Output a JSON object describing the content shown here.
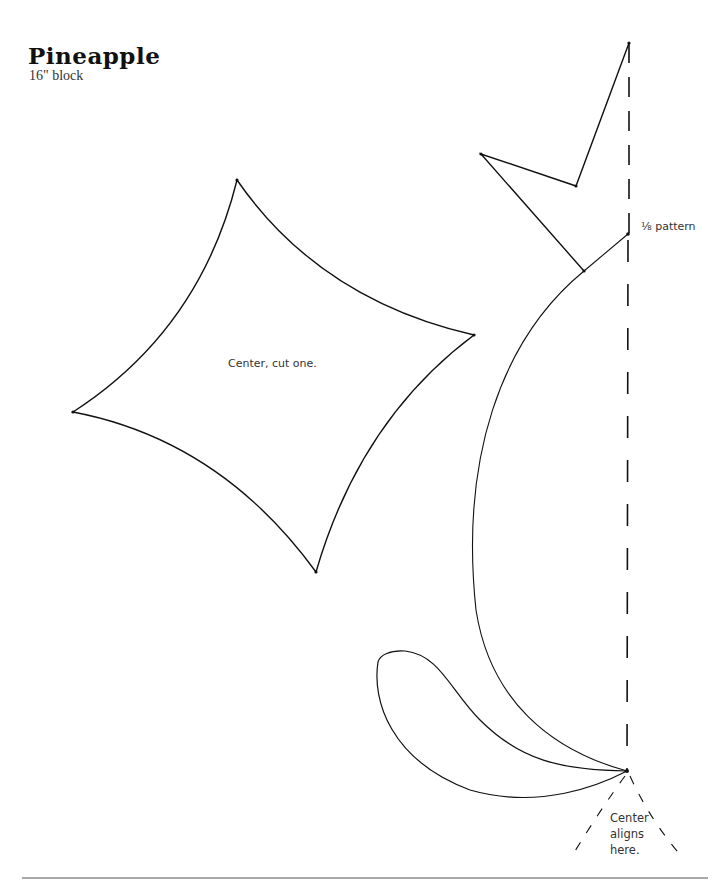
{
  "header": {
    "title": "Pineapple",
    "subtitle": "16\" block"
  },
  "labels": {
    "center_piece": "Center, cut one.",
    "pattern_fraction": "⅛ pattern",
    "align_line1": "Center",
    "align_line2": "aligns",
    "align_line3": "here."
  },
  "shapes": [
    {
      "name": "center-diamond",
      "instruction": "Center, cut one."
    },
    {
      "name": "crown-leaf"
    },
    {
      "name": "crescent-piece"
    },
    {
      "name": "teardrop-piece"
    }
  ],
  "colors": {
    "ink": "#111111",
    "background": "#ffffff",
    "rule": "#555555"
  }
}
